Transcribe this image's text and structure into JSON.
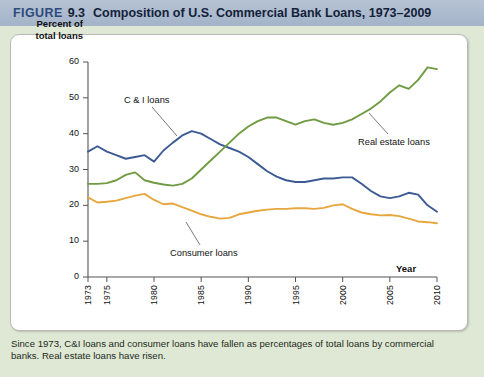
{
  "header": {
    "figure_word": "FIGURE",
    "figure_number": "9.3",
    "title": "Composition of U.S. Commercial Bank Loans, 1973–2009"
  },
  "caption": "Since 1973, C&I loans and consumer loans have fallen as percentages of total loans by commercial banks. Real estate loans have risen.",
  "axis": {
    "y_title_line1": "Percent of",
    "y_title_line2": "total loans",
    "x_title": "Year"
  },
  "annotations": {
    "ci": "C & I loans",
    "real_estate": "Real estate loans",
    "consumer": "Consumer loans"
  },
  "colors": {
    "ci_loans": "#3c5a93",
    "real_estate": "#6f9b43",
    "consumer": "#e8a63e",
    "header_bar": "#a8b8cc",
    "page_background": "#dfe8d4",
    "card_background": "#ffffff",
    "axis": "#555555"
  },
  "chart_data": {
    "type": "line",
    "title": "Composition of U.S. Commercial Bank Loans, 1973–2009",
    "xlabel": "Year",
    "ylabel": "Percent of total loans",
    "xlim": [
      1973,
      2010
    ],
    "ylim": [
      0,
      60
    ],
    "yticks": [
      0,
      10,
      20,
      30,
      40,
      50,
      60
    ],
    "xticks": [
      1973,
      1975,
      1980,
      1985,
      1990,
      1995,
      2000,
      2005,
      2010
    ],
    "xtick_labels": [
      "1973",
      "1975",
      "1980",
      "1985",
      "1990",
      "1995",
      "2000",
      "2005",
      "2010"
    ],
    "grid": false,
    "legend": "inline-annotations",
    "x": [
      1973,
      1974,
      1975,
      1976,
      1977,
      1978,
      1979,
      1980,
      1981,
      1982,
      1983,
      1984,
      1985,
      1986,
      1987,
      1988,
      1989,
      1990,
      1991,
      1992,
      1993,
      1994,
      1995,
      1996,
      1997,
      1998,
      1999,
      2000,
      2001,
      2002,
      2003,
      2004,
      2005,
      2006,
      2007,
      2008,
      2009,
      2010
    ],
    "series": [
      {
        "name": "C & I loans",
        "color": "#3c5a93",
        "values": [
          35.0,
          36.5,
          35.0,
          34.0,
          33.0,
          33.5,
          34.0,
          32.2,
          35.3,
          37.5,
          39.5,
          40.7,
          40.0,
          38.5,
          37.0,
          36.0,
          35.0,
          33.5,
          31.5,
          29.5,
          28.0,
          27.0,
          26.5,
          26.5,
          27.0,
          27.5,
          27.5,
          27.8,
          27.8,
          26.0,
          24.0,
          22.5,
          22.0,
          22.5,
          23.5,
          23.0,
          20.0,
          18.2
        ]
      },
      {
        "name": "Real estate loans",
        "color": "#6f9b43",
        "values": [
          26.0,
          26.0,
          26.2,
          27.0,
          28.5,
          29.2,
          27.0,
          26.3,
          25.8,
          25.5,
          26.0,
          27.5,
          30.0,
          32.5,
          35.0,
          37.5,
          40.0,
          42.0,
          43.5,
          44.5,
          44.5,
          43.5,
          42.5,
          43.5,
          44.0,
          43.0,
          42.5,
          43.0,
          44.0,
          45.5,
          47.0,
          49.0,
          51.5,
          53.5,
          52.5,
          55.0,
          58.5,
          58.0
        ]
      },
      {
        "name": "Consumer loans",
        "color": "#e8a63e",
        "values": [
          22.2,
          20.8,
          21.0,
          21.3,
          22.0,
          22.7,
          23.2,
          21.5,
          20.3,
          20.5,
          19.5,
          18.5,
          17.5,
          16.8,
          16.3,
          16.5,
          17.5,
          18.0,
          18.5,
          18.8,
          19.0,
          19.0,
          19.2,
          19.2,
          19.0,
          19.3,
          20.0,
          20.3,
          19.0,
          18.0,
          17.5,
          17.2,
          17.3,
          17.0,
          16.3,
          15.5,
          15.3,
          15.0
        ]
      }
    ]
  }
}
